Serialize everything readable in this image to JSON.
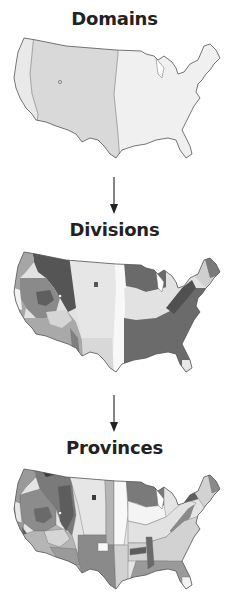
{
  "diagram": {
    "levels": [
      {
        "title": "Domains",
        "shades": [
          "#e6e6e6",
          "#d7d7d7",
          "#eeeeee"
        ]
      },
      {
        "title": "Divisions",
        "shades": [
          "#5d5d5d",
          "#8a8a8a",
          "#a9a9a9",
          "#cfcfcf",
          "#e4e4e4",
          "#f7f7f7"
        ]
      },
      {
        "title": "Provinces",
        "shades": [
          "#3a3a3a",
          "#5d5d5d",
          "#7a7a7a",
          "#9a9a9a",
          "#b5b5b5",
          "#d2d2d2",
          "#e6e6e6",
          "#f8f8f8"
        ]
      }
    ],
    "arrows": [
      "down-arrow",
      "down-arrow"
    ],
    "outline_color": "#555555"
  }
}
